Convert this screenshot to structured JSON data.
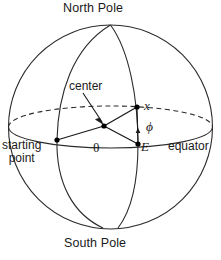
{
  "diagram": {
    "title_top": "North Pole",
    "title_bottom": "South Pole",
    "labels": {
      "north_pole": "North Pole",
      "south_pole": "South Pole",
      "center": "center",
      "point_x": "x",
      "point_E": "E",
      "angle_phi": "ϕ",
      "angle_theta": "θ",
      "equator": "equator",
      "starting_point_line1": "starting",
      "starting_point_line2": "point"
    },
    "colors": {
      "stroke": "#2b2b2b",
      "text": "#1a1a1a",
      "background": "#ffffff",
      "dot": "#000000"
    },
    "geometry": {
      "sphere_center_x": 110.5,
      "sphere_center_y": 127,
      "sphere_radius_x": 102,
      "sphere_radius_y": 102,
      "equator_ellipse_ry": 21,
      "point_center": [
        104,
        126
      ],
      "point_E": [
        138,
        144
      ],
      "point_x": [
        137,
        107
      ],
      "point_starting": [
        57,
        140
      ]
    }
  }
}
